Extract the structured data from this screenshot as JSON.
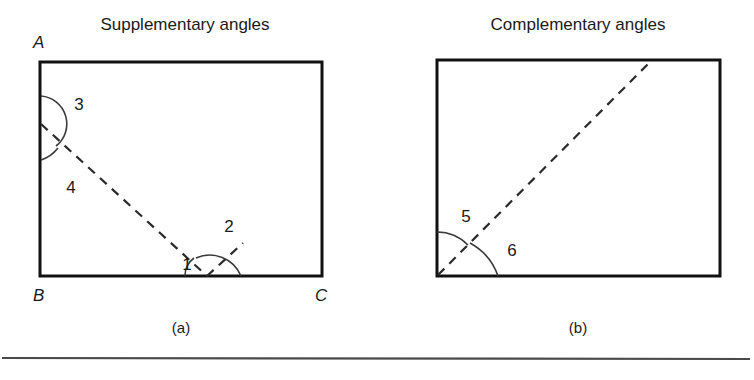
{
  "figure": {
    "panels": [
      {
        "id": "panel-a",
        "title": "Supplementary angles",
        "caption": "(a)",
        "vertex_labels": [
          {
            "name": "A",
            "text": "A"
          },
          {
            "name": "B",
            "text": "B"
          },
          {
            "name": "C",
            "text": "C"
          }
        ],
        "angle_labels": [
          {
            "name": "angle-1",
            "text": "1"
          },
          {
            "name": "angle-2",
            "text": "2"
          },
          {
            "name": "angle-3",
            "text": "3"
          },
          {
            "name": "angle-4",
            "text": "4"
          }
        ]
      },
      {
        "id": "panel-b",
        "title": "Complementary angles",
        "caption": "(b)",
        "vertex_labels": [],
        "angle_labels": [
          {
            "name": "angle-5",
            "text": "5"
          },
          {
            "name": "angle-6",
            "text": "6"
          }
        ]
      }
    ],
    "colors": {
      "rect_stroke": "#111111",
      "dashed_stroke": "#2a2a2a",
      "arc_stroke": "#3a3a3a",
      "text": "#1a1a1a",
      "background": "#ffffff",
      "divider": "#4a4a4a"
    }
  }
}
